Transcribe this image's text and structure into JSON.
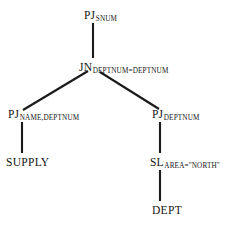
{
  "diagram": {
    "type": "query-tree",
    "background_color": "#ffffff",
    "line_color": "#1a1a1a",
    "text_color": "#151515",
    "nodes": [
      {
        "id": "root",
        "operator": "PJ",
        "subscript": "SNUM",
        "role": "project",
        "x": 93,
        "y": 18
      },
      {
        "id": "join",
        "operator": "JN",
        "subscript": "DEPTNUM=DEPTNUM",
        "role": "join",
        "x": 93,
        "y": 70
      },
      {
        "id": "proj-left",
        "operator": "PJ",
        "subscript": "NAME,DEPTNUM",
        "role": "project",
        "x": 22,
        "y": 117
      },
      {
        "id": "proj-right",
        "operator": "PJ",
        "subscript": "DEPTNUM",
        "role": "project",
        "x": 160,
        "y": 117
      },
      {
        "id": "select",
        "operator": "SL",
        "subscript": "AREA=\"NORTH\"",
        "role": "select",
        "x": 160,
        "y": 165
      }
    ],
    "leaves": [
      {
        "id": "supply",
        "label": "SUPPLY",
        "x": 22,
        "y": 213
      },
      {
        "id": "dept",
        "label": "DEPT",
        "x": 160,
        "y": 213
      }
    ],
    "edges": [
      {
        "from": "root",
        "to": "join",
        "kind": "vertical"
      },
      {
        "from": "join",
        "to": "proj-left",
        "kind": "diagonal"
      },
      {
        "from": "join",
        "to": "proj-right",
        "kind": "diagonal"
      },
      {
        "from": "proj-left",
        "to": "supply",
        "kind": "vertical"
      },
      {
        "from": "proj-right",
        "to": "select",
        "kind": "vertical"
      },
      {
        "from": "select",
        "to": "dept",
        "kind": "vertical"
      }
    ]
  }
}
